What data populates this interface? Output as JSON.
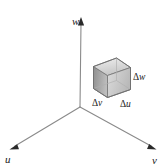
{
  "figure": {
    "type": "3d-coordinate-diagram",
    "background_color": "#ffffff",
    "line_color": "#6b6b6b",
    "text_color": "#1a1a1a"
  },
  "axes": {
    "origin": {
      "x": 80,
      "y": 107
    },
    "items": [
      {
        "name": "w",
        "label": "w",
        "direction": "up",
        "tip": {
          "x": 81,
          "y": 18
        },
        "label_position": {
          "x": 72,
          "y": 16
        }
      },
      {
        "name": "u",
        "label": "u",
        "direction": "lower-left",
        "tip": {
          "x": 11,
          "y": 149
        },
        "label_position": {
          "x": 5,
          "y": 154
        }
      },
      {
        "name": "v",
        "label": "v",
        "direction": "lower-right",
        "tip": {
          "x": 155,
          "y": 149
        },
        "label_position": {
          "x": 152,
          "y": 155
        }
      }
    ]
  },
  "volume_element": {
    "name": "differential-box",
    "shape": "rectangular-box",
    "bounds": {
      "x": 93,
      "y": 54,
      "width": 38,
      "height": 44
    },
    "faces": {
      "top_color": "#d9d9d9",
      "left_color": "#9c9c9c",
      "front_color": "#e8e8e8",
      "right_color": "#cfcfcf"
    },
    "edge_color": "#707070",
    "dimension_labels": [
      {
        "name": "delta-w",
        "delta": "Δ",
        "variable": "w",
        "text": "Δw",
        "position": {
          "x": 133,
          "y": 73
        },
        "edge": "vertical-right"
      },
      {
        "name": "delta-v",
        "delta": "Δ",
        "variable": "v",
        "text": "Δv",
        "position": {
          "x": 92,
          "y": 99
        },
        "edge": "bottom-left"
      },
      {
        "name": "delta-u",
        "delta": "Δ",
        "variable": "u",
        "text": "Δu",
        "position": {
          "x": 120,
          "y": 100
        },
        "edge": "bottom-right"
      }
    ]
  }
}
